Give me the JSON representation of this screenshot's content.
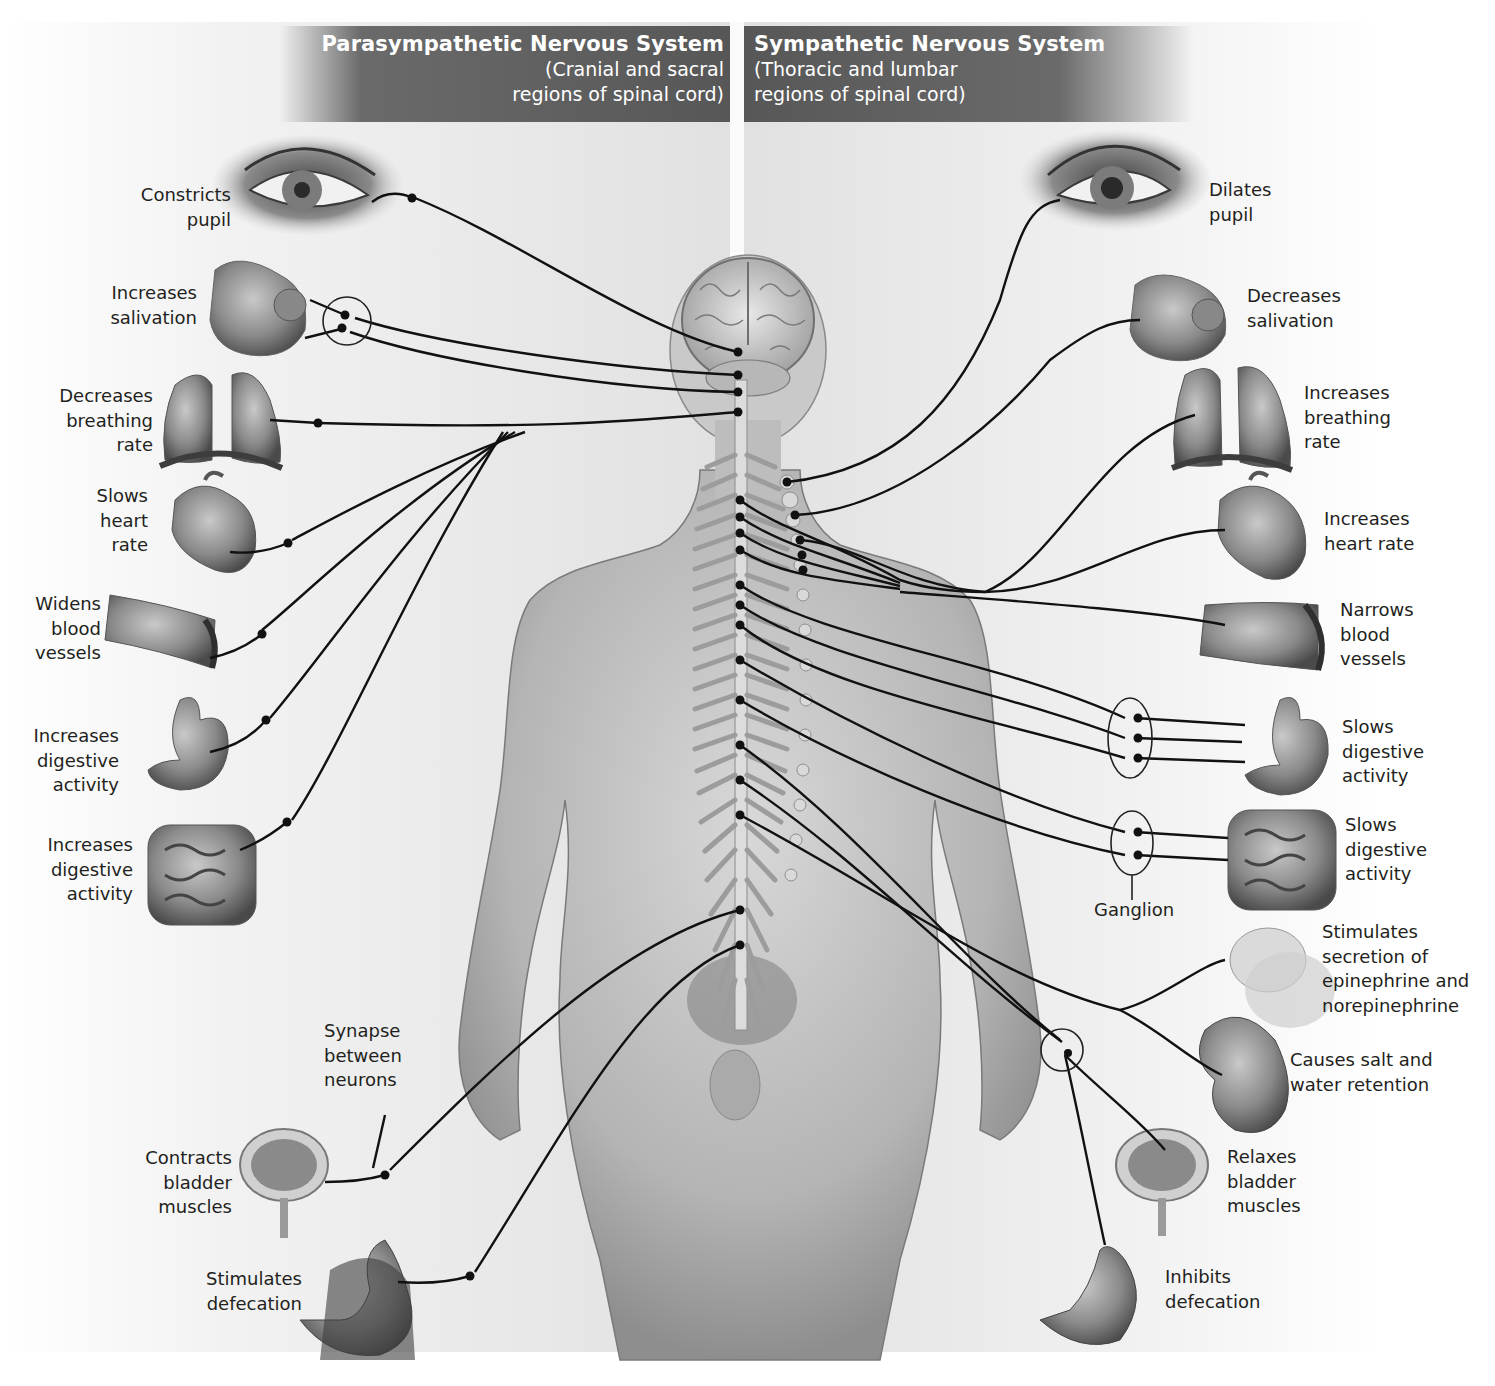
{
  "headers": {
    "parasympathetic": {
      "title": "Parasympathetic Nervous System",
      "subtitle_line1": "(Cranial and sacral",
      "subtitle_line2": "regions of spinal cord)"
    },
    "sympathetic": {
      "title": "Sympathetic Nervous System",
      "subtitle_line1": "(Thoracic and lumbar",
      "subtitle_line2": "regions of spinal cord)"
    }
  },
  "parasympathetic_effects": [
    {
      "organ": "eye",
      "label": "Constricts\npupil"
    },
    {
      "organ": "salivary-glands",
      "label": "Increases\nsalivation"
    },
    {
      "organ": "lungs",
      "label": "Decreases\nbreathing\nrate"
    },
    {
      "organ": "heart",
      "label": "Slows\nheart\nrate"
    },
    {
      "organ": "blood-vessels",
      "label": "Widens\nblood\nvessels"
    },
    {
      "organ": "stomach",
      "label": "Increases\ndigestive\nactivity"
    },
    {
      "organ": "intestines",
      "label": "Increases\ndigestive\nactivity"
    },
    {
      "organ": "bladder",
      "label": "Contracts\nbladder\nmuscles"
    },
    {
      "organ": "rectum",
      "label": "Stimulates\ndefecation"
    }
  ],
  "sympathetic_effects": [
    {
      "organ": "eye",
      "label": "Dilates\npupil"
    },
    {
      "organ": "salivary-glands",
      "label": "Decreases\nsalivation"
    },
    {
      "organ": "lungs",
      "label": "Increases\nbreathing\nrate"
    },
    {
      "organ": "heart",
      "label": "Increases\nheart rate"
    },
    {
      "organ": "blood-vessels",
      "label": "Narrows\nblood\nvessels"
    },
    {
      "organ": "stomach",
      "label": "Slows\ndigestive\nactivity"
    },
    {
      "organ": "intestines",
      "label": "Slows\ndigestive\nactivity"
    },
    {
      "organ": "adrenal-gland",
      "label": "Stimulates\nsecretion of\nepinephrine and\nnorepinephrine"
    },
    {
      "organ": "kidney",
      "label": "Causes salt and\nwater retention"
    },
    {
      "organ": "bladder",
      "label": "Relaxes\nbladder\nmuscles"
    },
    {
      "organ": "rectum",
      "label": "Inhibits\ndefecation"
    }
  ],
  "annotations": {
    "synapse": "Synapse\nbetween\nneurons",
    "ganglion": "Ganglion"
  },
  "colors": {
    "header_bg": "#575757",
    "header_text": "#ffffff",
    "nerve_line": "#111111",
    "label_text": "#231f20",
    "body_gray": "#9a9a9a"
  }
}
